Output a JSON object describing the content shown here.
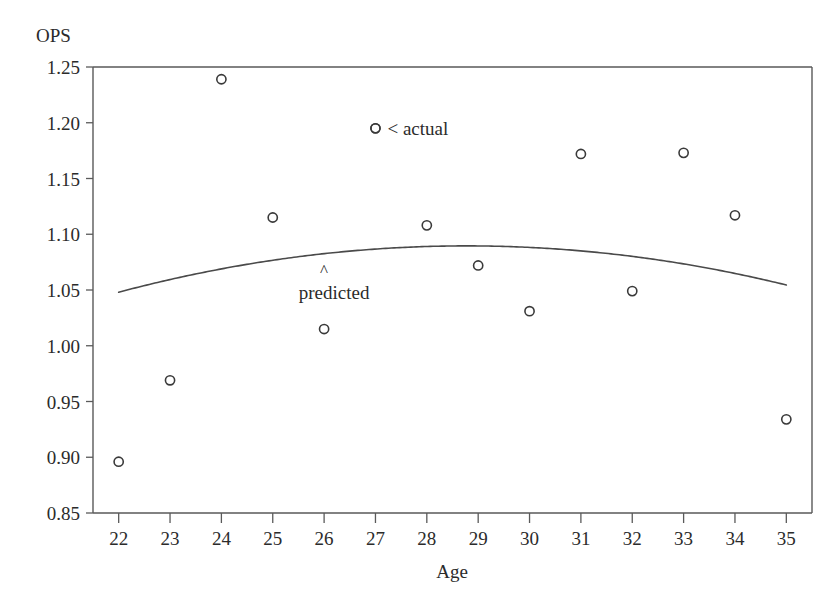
{
  "chart_data": {
    "type": "scatter",
    "title": "",
    "ylabel": "OPS",
    "xlabel": "Age",
    "xlim": [
      21.5,
      35.5
    ],
    "ylim": [
      0.85,
      1.25
    ],
    "grid": false,
    "legend_position": "inside-plot",
    "x_ticks": [
      22,
      23,
      24,
      25,
      26,
      27,
      28,
      29,
      30,
      31,
      32,
      33,
      34,
      35
    ],
    "x_tick_labels": [
      "22",
      "23",
      "24",
      "25",
      "26",
      "27",
      "28",
      "29",
      "30",
      "31",
      "32",
      "33",
      "34",
      "35"
    ],
    "y_ticks": [
      0.85,
      0.9,
      0.95,
      1.0,
      1.05,
      1.1,
      1.15,
      1.2,
      1.25
    ],
    "y_tick_labels": [
      "0.85",
      "0.90",
      "0.95",
      "1.00",
      "1.05",
      "1.10",
      "1.15",
      "1.20",
      "1.25"
    ],
    "series": [
      {
        "name": "actual",
        "type": "scatter",
        "marker": "open-circle",
        "x": [
          22,
          23,
          24,
          25,
          26,
          27,
          28,
          29,
          30,
          31,
          32,
          33,
          34,
          35
        ],
        "values": [
          0.896,
          0.969,
          1.239,
          1.115,
          1.015,
          1.195,
          1.108,
          1.072,
          1.031,
          1.172,
          1.049,
          1.173,
          1.117,
          0.934
        ]
      },
      {
        "name": "predicted",
        "type": "line",
        "x": [
          22,
          23,
          24,
          25,
          26,
          27,
          28,
          29,
          30,
          31,
          32,
          33,
          34,
          35
        ],
        "values": [
          1.042,
          1.058,
          1.071,
          1.08,
          1.087,
          1.091,
          1.092,
          1.091,
          1.087,
          1.081,
          1.073,
          1.062,
          1.066,
          1.066
        ]
      }
    ],
    "annotations": [
      {
        "id": "actual-legend",
        "text": "< actual",
        "marker": "open-circle",
        "x": 27,
        "y": 1.195
      },
      {
        "id": "predicted-label",
        "text": "predicted",
        "caret": "^",
        "x": 26.0,
        "y": 1.063
      }
    ]
  }
}
